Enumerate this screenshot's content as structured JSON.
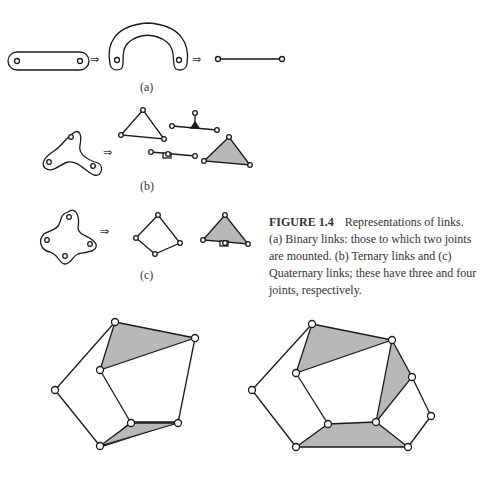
{
  "figure": {
    "number": "FIGURE 1.4",
    "title": "Representations of links.",
    "caption_body": "(a) Binary links: those to which two joints are mounted. (b) Ternary links and (c) Quaternary links; these have three and four joints, respectively."
  },
  "panels": {
    "a": {
      "label": "(a)",
      "description": "Binary link: straight bar and curved bar with two joints, simplified to a line segment with two joints"
    },
    "b": {
      "label": "(b)",
      "description": "Ternary link: three-lobed shape, represented as triangles and lines with three joints"
    },
    "c": {
      "label": "(c)",
      "description": "Quaternary link: four-lobed shape, represented as quadrilateral and shaded triangle with four joints"
    }
  },
  "arrows": [
    "⇒",
    "⇒",
    "⇒",
    "⇒"
  ],
  "colors": {
    "stroke": "#1a1a1a",
    "shade": "#b8b8b8",
    "background": "#ffffff"
  }
}
